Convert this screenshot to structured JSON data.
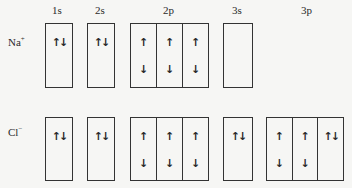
{
  "headers": [
    "1s",
    "2s",
    "2p",
    "3s",
    "3p"
  ],
  "ions": [
    {
      "label": "Na",
      "charge": "+",
      "orbitals": {
        "1s": [
          "↑↓"
        ],
        "2s": [
          "↑↓"
        ],
        "2p": [
          "↑↓",
          "↑↓",
          "↑↓"
        ],
        "3s": [
          ""
        ]
      }
    },
    {
      "label": "Cl",
      "charge": "−",
      "orbitals": {
        "1s": [
          "↑↓"
        ],
        "2s": [
          "↑↓"
        ],
        "2p": [
          "↑↓",
          "↑↓",
          "↑↓"
        ],
        "3s": [
          "↑↓"
        ],
        "3p": [
          "↑↓",
          "↑↓",
          "↑↓"
        ]
      }
    }
  ],
  "arrows": {
    "up": "↑",
    "down": "↓"
  }
}
